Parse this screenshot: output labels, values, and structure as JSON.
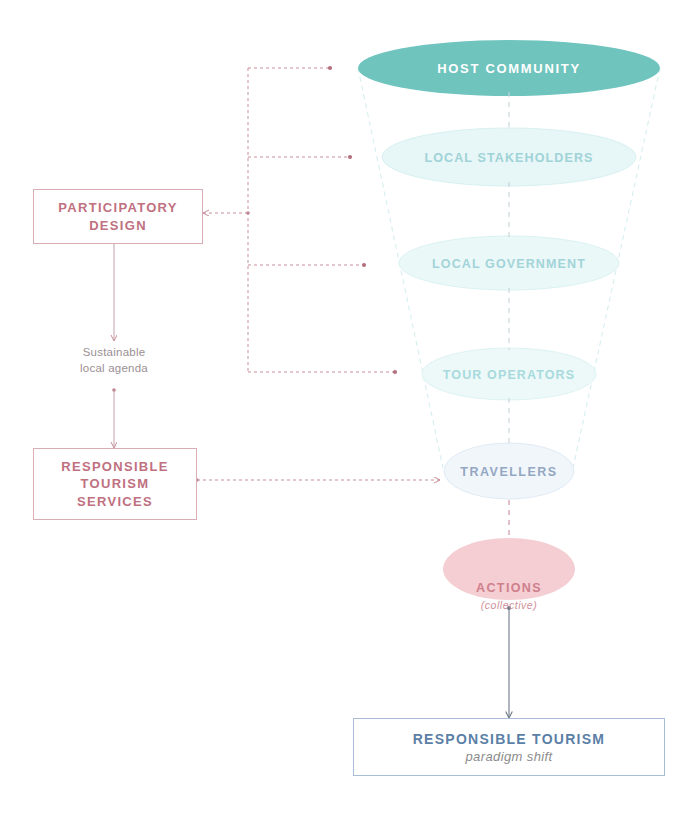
{
  "diagram": {
    "colors": {
      "teal_solid": "#6fc4be",
      "teal_pale": "#e8f6f6",
      "blue_pale": "#eef4fa",
      "pink_solid": "#f4ced3",
      "pink_line": "#c98f99",
      "blue_line": "#a8bdd6",
      "funnel_outline": "#dbeef0",
      "dash_grey": "#b9c6d2",
      "arrow_grey": "#6d7a86"
    },
    "funnel": {
      "levels": [
        {
          "id": "host-community",
          "label": "HOST COMMUNITY",
          "fill": "#6fc4be",
          "text_color": "#ffffff"
        },
        {
          "id": "local-stakeholders",
          "label": "LOCAL STAKEHOLDERS",
          "fill": "#e9f7f7",
          "text_color": "#9fd3d8"
        },
        {
          "id": "local-government",
          "label": "LOCAL GOVERNMENT",
          "fill": "#ecf8f8",
          "text_color": "#a2d4d9"
        },
        {
          "id": "tour-operators",
          "label": "TOUR OPERATORS",
          "fill": "#eef9f9",
          "text_color": "#a8d9dd"
        },
        {
          "id": "travellers",
          "label": "TRAVELLERS",
          "fill": "#f1f6fb",
          "text_color": "#93a7c2"
        }
      ]
    },
    "actions": {
      "label": "ACTIONS",
      "sublabel": "(collective)",
      "fill": "#f4ced3"
    },
    "boxes": {
      "participatory_design": {
        "title": "PARTICIPATORY\nDESIGN"
      },
      "responsible_tourism_services": {
        "title": "RESPONSIBLE\nTOURISM\nSERVICES"
      },
      "responsible_tourism": {
        "title": "RESPONSIBLE TOURISM",
        "subtitle": "paradigm shift"
      }
    },
    "notes": {
      "sustainable_local_agenda": "Sustainable\nlocal agenda"
    }
  }
}
